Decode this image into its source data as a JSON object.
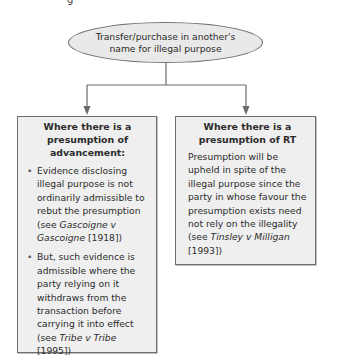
{
  "top_fragment": "g",
  "root": {
    "label": "Transfer/purchase in another's name for illegal purpose"
  },
  "branches": [
    {
      "title": "Where there is a presumption of advancement:",
      "bullets": [
        {
          "pre": "Evidence disclosing illegal purpose is not ordinarily admissible to rebut the presumption (see ",
          "case": "Gascoigne v Gascoigne",
          "post": " [1918])"
        },
        {
          "pre": "But, such evidence is admissible where the party relying on it withdraws from the transaction before carrying it into effect (see ",
          "case": "Tribe v Tribe",
          "post": " [1995])"
        }
      ]
    },
    {
      "title": "Where there is a presumption of RT",
      "text": {
        "pre": "Presumption will be upheld in spite of the illegal purpose since the party in whose favour the presumption exists need not rely on the illegality (see ",
        "case": "Tinsley v Milligan",
        "post": " [1993])"
      }
    }
  ],
  "colors": {
    "node_fill": "#efefef",
    "node_border": "#6e6e6e",
    "connector": "#6a6a6a"
  }
}
